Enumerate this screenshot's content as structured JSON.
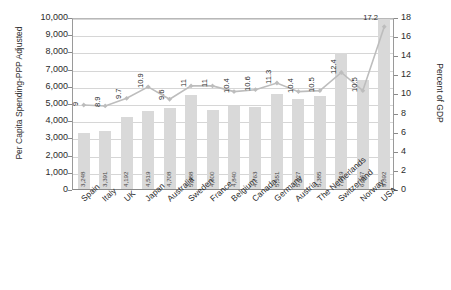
{
  "chart_data": {
    "type": "bar",
    "title": "",
    "categories": [
      "Spain",
      "Italy",
      "UK",
      "Japan",
      "Australia",
      "Sweden",
      "France",
      "Belgium",
      "Canada",
      "Germany",
      "Austria",
      "The Netherlands",
      "Switzerland",
      "Norway",
      "USA"
    ],
    "series": [
      {
        "name": "Per Capita Spending-PPP Adjusted",
        "type": "bar",
        "axis": "left",
        "values": [
          3248,
          3391,
          4192,
          4519,
          4708,
          5488,
          4600,
          4840,
          4763,
          5551,
          5227,
          5385,
          7919,
          6347,
          9892
        ],
        "labels": [
          "3,248",
          "3,391",
          "4,192",
          "4,519",
          "4,708",
          "5,488",
          "4,600",
          "4,840",
          "4,763",
          "5,551",
          "5,227",
          "5,385",
          "7,919",
          "6,347",
          "9,892"
        ],
        "color": "#d9d9d9"
      },
      {
        "name": "Percent of GDP",
        "type": "line",
        "axis": "right",
        "values": [
          9,
          8.9,
          9.7,
          10.9,
          9.6,
          11,
          11,
          10.4,
          10.6,
          11.3,
          10.4,
          10.5,
          12.4,
          10.5,
          17.2
        ],
        "labels": [
          "9",
          "8.9",
          "9.7",
          "10.9",
          "9.6",
          "11",
          "11",
          "10.4",
          "10.6",
          "11.3",
          "10.4",
          "10.5",
          "12.4",
          "10.5",
          "17.2"
        ],
        "color": "#bdbdbd"
      }
    ],
    "ylabel": "Per Capita Spending-PPP Adjusted",
    "y2label": "Percent of GDP",
    "xlabel": "",
    "ylim": [
      0,
      10000
    ],
    "y2lim": [
      0,
      18
    ],
    "yticks": [
      "0",
      "1,000",
      "2,000",
      "3,000",
      "4,000",
      "5,000",
      "6,000",
      "7,000",
      "8,000",
      "9,000",
      "10,000"
    ],
    "y2ticks": [
      "0",
      "2",
      "4",
      "6",
      "8",
      "10",
      "12",
      "14",
      "16",
      "18"
    ],
    "grid": true,
    "legend": "none"
  }
}
